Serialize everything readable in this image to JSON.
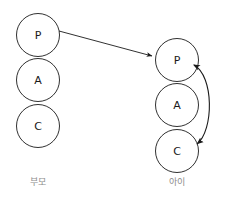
{
  "diagram": {
    "background_color": "#ffffff",
    "stroke_color": "#1a1a1a",
    "caption_color": "#8c8c8c",
    "groups": [
      {
        "id": "parent",
        "caption": "부모",
        "caption_x": 38,
        "caption_y": 182,
        "center_x": 38,
        "radius": 21.5,
        "nodes": [
          {
            "label": "P",
            "cx": 38,
            "cy": 35
          },
          {
            "label": "A",
            "cx": 38,
            "cy": 80
          },
          {
            "label": "C",
            "cx": 38,
            "cy": 126
          }
        ]
      },
      {
        "id": "child",
        "caption": "아이",
        "caption_x": 177,
        "caption_y": 182,
        "center_x": 177,
        "radius": 21.5,
        "nodes": [
          {
            "label": "P",
            "cx": 177,
            "cy": 60
          },
          {
            "label": "A",
            "cx": 177,
            "cy": 105
          },
          {
            "label": "C",
            "cx": 177,
            "cy": 151
          }
        ]
      }
    ],
    "edges": [
      {
        "id": "parent-p-to-child-p",
        "kind": "straight-arrow",
        "from": "parent.P",
        "to": "child.P",
        "x1": 59,
        "y1": 31,
        "x2": 154,
        "y2": 57,
        "arrowheads": "end"
      },
      {
        "id": "child-p-c-bidirectional",
        "kind": "curved-double-arrow",
        "from": "child.C",
        "to": "child.P",
        "path": "M 195 63 C 216 72, 216 132, 198 146",
        "arrowheads": "both"
      }
    ]
  }
}
